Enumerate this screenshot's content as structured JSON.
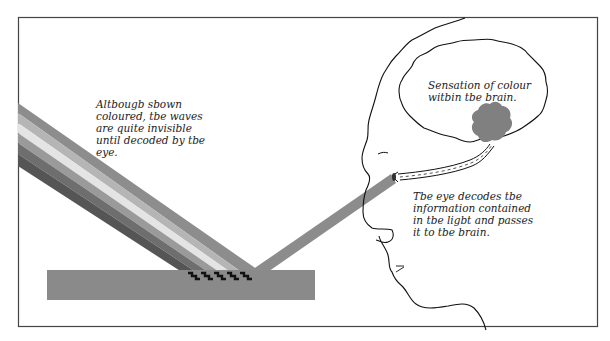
{
  "diagram": {
    "captions": {
      "waves": "Altbougb sbown\ncoloured, tbe waves\nare quite invisible\nuntil decoded by tbe\neye.",
      "brain": "Sensation of colour\nwitbin tbe brain.",
      "eye": "Tbe eye decodes tbe\ninformation contained\nin tbe ligbt and passes\nit to tbe brain."
    },
    "colors": {
      "frame": "#444444",
      "surface": "#8a8a8a",
      "reflected_beam": "#8c8c8c",
      "brain_spot": "#808080",
      "bands": [
        "#8d8d8d",
        "#b5b5b5",
        "#e4e4e4",
        "#9a9a9a",
        "#6e6e6e",
        "#555555"
      ]
    },
    "elements": [
      "incident-light-beam",
      "reflective-surface",
      "absorption-wave-marks",
      "reflected-light-beam",
      "head-profile",
      "brain-outline",
      "colour-sensation-spot",
      "optic-nerve",
      "eye"
    ]
  }
}
